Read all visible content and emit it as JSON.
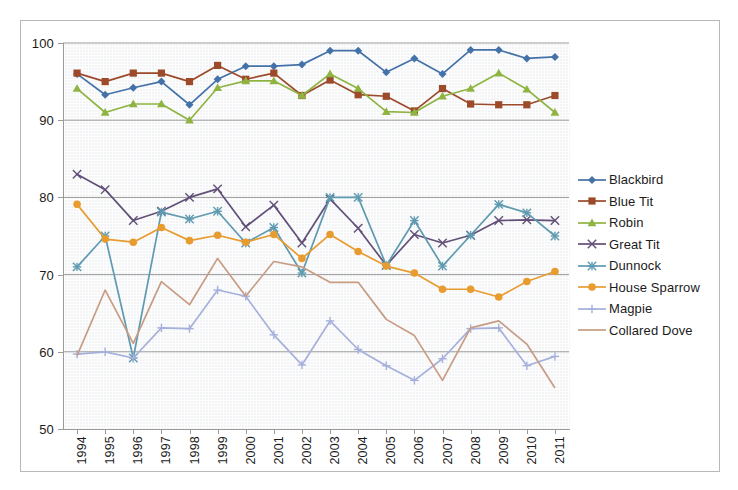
{
  "chart_data": {
    "type": "line",
    "title": "",
    "xlabel": "",
    "ylabel": "",
    "grid": true,
    "legend_position": "right",
    "ylim": [
      50,
      100
    ],
    "yticks": [
      50,
      60,
      70,
      80,
      90,
      100
    ],
    "categories": [
      "1994",
      "1995",
      "1996",
      "1997",
      "1998",
      "1999",
      "2000",
      "2001",
      "2002",
      "2003",
      "2004",
      "2005",
      "2006",
      "2007",
      "2008",
      "2009",
      "2010",
      "2011"
    ],
    "series": [
      {
        "name": "Blackbird",
        "color": "#4472a8",
        "marker": "diamond",
        "values": [
          96.0,
          93.3,
          94.2,
          95.0,
          92.0,
          95.3,
          97.0,
          97.0,
          97.2,
          99.0,
          99.0,
          96.2,
          98.0,
          96.0,
          99.1,
          99.1,
          98.0,
          98.2
        ]
      },
      {
        "name": "Blue Tit",
        "color": "#9c4a2a",
        "marker": "square",
        "values": [
          96.1,
          95.0,
          96.1,
          96.1,
          95.0,
          97.1,
          95.3,
          96.1,
          93.2,
          95.2,
          93.3,
          93.1,
          91.2,
          94.1,
          92.1,
          92.0,
          92.0,
          93.2
        ]
      },
      {
        "name": "Robin",
        "color": "#8fb442",
        "marker": "triangle",
        "values": [
          94.1,
          91.0,
          92.1,
          92.1,
          90.0,
          94.2,
          95.1,
          95.1,
          93.2,
          96.0,
          94.1,
          91.1,
          91.0,
          93.1,
          94.1,
          96.1,
          94.0,
          91.0
        ]
      },
      {
        "name": "Great Tit",
        "color": "#625078",
        "marker": "x",
        "values": [
          83.0,
          81.0,
          77.0,
          78.2,
          80.0,
          81.1,
          76.2,
          79.0,
          74.1,
          79.8,
          76.0,
          71.2,
          75.2,
          74.1,
          75.1,
          77.0,
          77.1,
          77.0
        ]
      },
      {
        "name": "Dunnock",
        "color": "#5f9ab0",
        "marker": "star",
        "values": [
          71.0,
          75.0,
          59.2,
          78.1,
          77.2,
          78.2,
          74.1,
          76.1,
          70.2,
          80.0,
          80.0,
          71.2,
          77.0,
          71.1,
          75.1,
          79.1,
          78.0,
          75.0
        ]
      },
      {
        "name": "House Sparrow",
        "color": "#e89c30",
        "marker": "circle",
        "values": [
          79.1,
          74.6,
          74.2,
          76.1,
          74.4,
          75.1,
          74.2,
          75.2,
          72.1,
          75.2,
          73.0,
          71.1,
          70.2,
          68.1,
          68.1,
          67.1,
          69.1,
          70.4
        ]
      },
      {
        "name": "Magpie",
        "color": "#a6b0db",
        "marker": "plus",
        "values": [
          59.7,
          60.0,
          59.2,
          63.1,
          63.0,
          68.0,
          67.2,
          62.2,
          58.3,
          64.0,
          60.3,
          58.2,
          56.3,
          59.1,
          63.0,
          63.1,
          58.2,
          59.4
        ]
      },
      {
        "name": "Collared Dove",
        "color": "#c89c84",
        "marker": "none",
        "values": [
          59.5,
          68.0,
          61.1,
          69.1,
          66.1,
          72.1,
          67.2,
          71.7,
          71.0,
          69.0,
          69.0,
          64.2,
          62.1,
          56.3,
          63.1,
          64.0,
          61.0,
          55.3
        ]
      }
    ]
  }
}
